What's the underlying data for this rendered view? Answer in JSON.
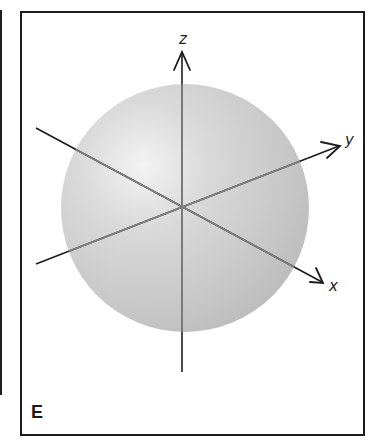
{
  "figure": {
    "panel_label": "E",
    "axes": {
      "x": {
        "label": "x"
      },
      "y": {
        "label": "y"
      },
      "z": {
        "label": "z"
      }
    },
    "sphere": {
      "fill": "#c8c8c8",
      "highlight": "#f2f2f2",
      "edge_shade": "#bdbdbd"
    },
    "colors": {
      "axis_outside": "#1c1c1c",
      "axis_inside": "#7a7a7a",
      "frame": "#1c1c1c"
    }
  }
}
